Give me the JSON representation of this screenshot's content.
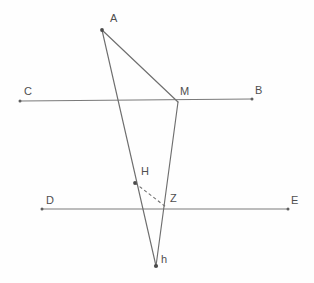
{
  "diagram": {
    "background_color": "#fefefe",
    "stroke_color": "#6e6e6e",
    "label_color": "#4f4f4f",
    "points": [
      {
        "id": "A",
        "label": "A",
        "x": 102,
        "y": 30,
        "label_x": 110,
        "label_y": 13,
        "marked": true
      },
      {
        "id": "B",
        "label": "B",
        "x": 252,
        "y": 99,
        "label_x": 255,
        "label_y": 85,
        "marked": true
      },
      {
        "id": "C",
        "label": "C",
        "x": 20,
        "y": 101,
        "label_x": 24,
        "label_y": 86,
        "marked": true
      },
      {
        "id": "D",
        "label": "D",
        "x": 42,
        "y": 209,
        "label_x": 46,
        "label_y": 195,
        "marked": true
      },
      {
        "id": "E",
        "label": "E",
        "x": 288,
        "y": 209,
        "label_x": 291,
        "label_y": 195,
        "marked": true
      },
      {
        "id": "M",
        "label": "M",
        "x": 178,
        "y": 102,
        "label_x": 180,
        "label_y": 86,
        "marked": false
      },
      {
        "id": "H",
        "label": "H",
        "x": 135,
        "y": 183,
        "label_x": 141,
        "label_y": 166,
        "marked": true
      },
      {
        "id": "Z",
        "label": "Z",
        "x": 166,
        "y": 207,
        "label_x": 170,
        "label_y": 193,
        "marked": false
      },
      {
        "id": "h",
        "label": "h",
        "x": 156,
        "y": 266,
        "label_x": 161,
        "label_y": 254,
        "marked": true
      }
    ],
    "lines": [
      {
        "id": "line-CB",
        "name": "parallel-line-CB",
        "from": "C",
        "to": "B",
        "style": "solid",
        "x1": 20,
        "y1": 101,
        "x2": 252,
        "y2": 99
      },
      {
        "id": "line-DE",
        "name": "parallel-line-DE",
        "from": "D",
        "to": "E",
        "style": "solid",
        "x1": 42,
        "y1": 209,
        "x2": 288,
        "y2": 209
      },
      {
        "id": "seg-AM",
        "name": "segment-AM",
        "from": "A",
        "to": "M",
        "style": "solid",
        "x1": 102,
        "y1": 30,
        "x2": 178,
        "y2": 102
      },
      {
        "id": "seg-Ah",
        "name": "segment-A-to-h",
        "from": "A",
        "to": "h",
        "style": "solid",
        "x1": 102,
        "y1": 30,
        "x2": 156,
        "y2": 266
      },
      {
        "id": "seg-Mh",
        "name": "segment-M-to-h",
        "from": "M",
        "to": "h",
        "style": "solid",
        "x1": 178,
        "y1": 102,
        "x2": 156,
        "y2": 266
      },
      {
        "id": "seg-HZ",
        "name": "dashed-segment-HZ",
        "from": "H",
        "to": "Z",
        "style": "dashed",
        "x1": 135,
        "y1": 183,
        "x2": 166,
        "y2": 207
      }
    ]
  }
}
